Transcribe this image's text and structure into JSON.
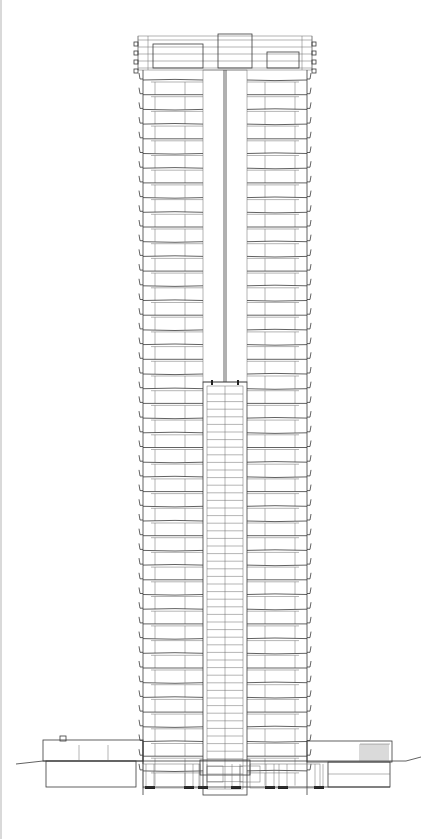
{
  "drawing": {
    "type": "building-section",
    "colors": {
      "line": "#3a3a3a",
      "thin": "#6a6a6a",
      "background": "#ffffff"
    },
    "tower": {
      "left": 143,
      "right": 307,
      "top": 70,
      "bottom": 795,
      "floor_count": 48,
      "first_floor_y": 80,
      "floor_height": 14.7,
      "core_left": 203,
      "core_right": 247,
      "core_mid": 225,
      "unit_split_left": 185,
      "unit_split_right": 265,
      "balcony_offset": 4
    },
    "crown": {
      "top": 36,
      "bottom": 70,
      "left": 143,
      "right": 307,
      "tank": {
        "x": 218,
        "y": 34,
        "w": 34,
        "h": 34
      },
      "left_box": {
        "x": 153,
        "y": 44,
        "w": 50,
        "h": 24
      },
      "right_box": {
        "x": 267,
        "y": 52,
        "w": 32,
        "h": 16
      }
    },
    "lower_core": {
      "x": 203,
      "y": 382,
      "w": 44,
      "h": 413,
      "line_spacing": 7.6
    },
    "upper_core": {
      "x": 203,
      "y": 70,
      "w": 44,
      "h": 312
    },
    "podium": {
      "left": 43,
      "right": 392,
      "top": 735,
      "ground_y": 760,
      "base_y": 786,
      "ground_line": {
        "x1": 16,
        "y1": 764,
        "x2": 421,
        "y2": 759
      }
    },
    "footings": [
      150,
      189,
      203,
      236,
      270,
      283,
      319
    ]
  }
}
